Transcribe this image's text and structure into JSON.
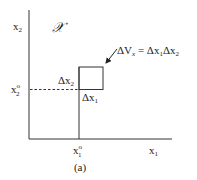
{
  "figure": {
    "axis_x_label": "x",
    "axis_x_sub": "1",
    "axis_y_label": "x",
    "axis_y_sub": "2",
    "space_symbol": "𝒳",
    "tick_x_label": "x",
    "tick_x_sub": "1",
    "tick_x_sup": "o",
    "tick_y_label": "x",
    "tick_y_sub": "2",
    "tick_y_sup": "o",
    "delta_x1": "Δx",
    "delta_x1_sub": "1",
    "delta_x2": "Δx",
    "delta_x2_sub": "2",
    "volume_lhs": "ΔV",
    "volume_lhs_sub": "x",
    "volume_rhs_a": " = Δx",
    "volume_rhs_a_sub": "1",
    "volume_rhs_b": "Δx",
    "volume_rhs_b_sub": "2",
    "caption": "(a)"
  }
}
